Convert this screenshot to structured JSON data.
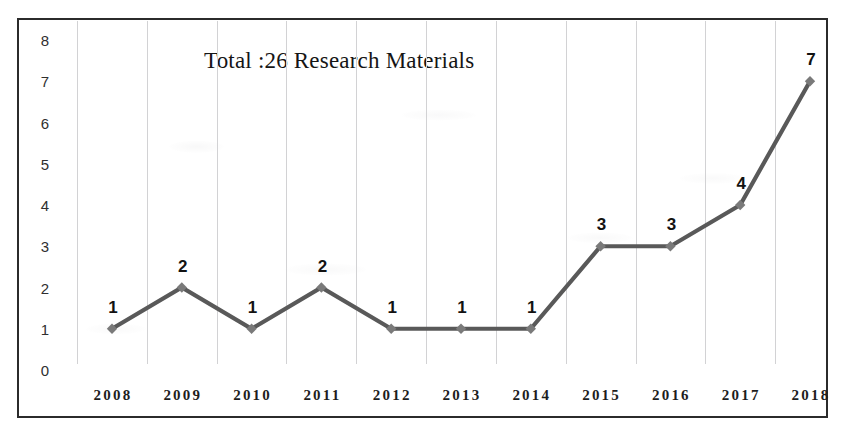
{
  "chart_data": {
    "type": "line",
    "title": "Total :26 Research Materials",
    "xlabel": "",
    "ylabel": "",
    "categories": [
      "2008",
      "2009",
      "2010",
      "2011",
      "2012",
      "2013",
      "2014",
      "2015",
      "2016",
      "2017",
      "2018"
    ],
    "values": [
      1,
      2,
      1,
      2,
      1,
      1,
      1,
      3,
      3,
      4,
      7
    ],
    "point_labels": [
      "1",
      "2",
      "1",
      "2",
      "1",
      "1",
      "1",
      "3",
      "3",
      "4",
      "7"
    ],
    "ylim": [
      0,
      8
    ],
    "yticks": [
      "0",
      "1",
      "2",
      "3",
      "4",
      "5",
      "6",
      "7",
      "8"
    ],
    "grid": "vertical-only",
    "legend": "none",
    "series": [
      {
        "name": "Research Materials",
        "values": [
          1,
          2,
          1,
          2,
          1,
          1,
          1,
          3,
          3,
          4,
          7
        ],
        "marker": "diamond",
        "line_color": "#595959",
        "marker_color": "#7a7a7a"
      }
    ],
    "total": 26
  },
  "style": {
    "frame_color": "#2b2b2b",
    "gridline_color": "#d2d2d4",
    "background": "#ffffff",
    "label_color": "#121212"
  }
}
